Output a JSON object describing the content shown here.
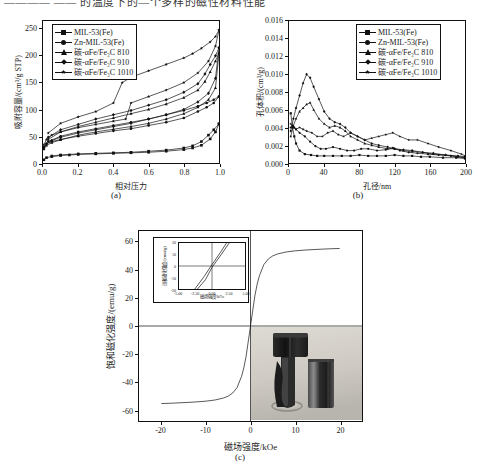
{
  "header": {
    "cropped_line": "————  ——  的温度下的—个多样的磁性材料性能"
  },
  "panels": [
    {
      "id": "a",
      "caption": "(a)",
      "xlabel": "相对压力",
      "ylabel": "吸附容量/(cm³/g STP)"
    },
    {
      "id": "b",
      "caption": "(b)",
      "xlabel": "孔径/nm",
      "ylabel": "孔体积/(cm³/g)"
    },
    {
      "id": "c",
      "caption": "(c)",
      "xlabel": "磁场强度/kOe",
      "ylabel": "饱和磁化强度/(emu/g)",
      "inset": {
        "xlabel": "磁场强度/kOe",
        "ylabel": "饱和磁化强度/(emu/g)"
      },
      "photo_alt": "磁铁吸附照片"
    }
  ],
  "legend": {
    "entries": [
      {
        "label": "MIL-53(Fe)",
        "marker": "sq",
        "color": "#111111"
      },
      {
        "label": "Zn-MIL-53(Fe)",
        "marker": "cir",
        "color": "#111111"
      },
      {
        "label": "碳-αFe/Fe₃C 810",
        "marker": "tri",
        "color": "#111111"
      },
      {
        "label": "碳-αFe/Fe₃C 910",
        "marker": "dia",
        "color": "#111111"
      },
      {
        "label": "碳-αFe/Fe₃C 1010",
        "marker": "star",
        "color": "#111111"
      }
    ]
  },
  "chart_data": [
    {
      "type": "line",
      "panel": "a",
      "title": "",
      "xlabel": "相对压力",
      "ylabel": "吸附容量/(cm³/g STP)",
      "xlim": [
        0.0,
        1.0
      ],
      "ylim": [
        0,
        265
      ],
      "xticks": [
        "0.0",
        "0.2",
        "0.4",
        "0.6",
        "0.8",
        "1.0"
      ],
      "yticks": [
        "0",
        "50",
        "100",
        "150",
        "200",
        "250"
      ],
      "grid": false,
      "legend_position": "top-left",
      "series": [
        {
          "name": "MIL-53(Fe)",
          "marker": "sq",
          "adsorption_x": [
            0.005,
            0.02,
            0.05,
            0.1,
            0.15,
            0.2,
            0.3,
            0.4,
            0.5,
            0.6,
            0.7,
            0.8,
            0.85,
            0.9,
            0.95,
            0.98,
            1.0
          ],
          "adsorption_y": [
            6,
            10,
            12,
            14,
            15,
            16,
            17,
            18,
            19,
            20,
            22,
            25,
            28,
            33,
            45,
            58,
            73
          ],
          "desorption_x": [
            1.0,
            0.97,
            0.94,
            0.9,
            0.85,
            0.8,
            0.7,
            0.6,
            0.5,
            0.4,
            0.3,
            0.2,
            0.1,
            0.05
          ],
          "desorption_y": [
            73,
            62,
            52,
            40,
            32,
            28,
            24,
            22,
            20,
            19,
            18,
            17,
            15,
            13
          ]
        },
        {
          "name": "Zn-MIL-53(Fe)",
          "marker": "cir",
          "adsorption_x": [
            0.005,
            0.02,
            0.05,
            0.1,
            0.2,
            0.3,
            0.4,
            0.5,
            0.6,
            0.7,
            0.8,
            0.88,
            0.93,
            0.97,
            1.0
          ],
          "adsorption_y": [
            30,
            36,
            40,
            44,
            50,
            55,
            60,
            64,
            70,
            76,
            84,
            96,
            104,
            112,
            124
          ],
          "desorption_x": [
            1.0,
            0.97,
            0.93,
            0.88,
            0.8,
            0.7,
            0.6,
            0.5,
            0.4,
            0.3,
            0.2,
            0.1,
            0.03
          ],
          "desorption_y": [
            124,
            118,
            112,
            106,
            98,
            90,
            82,
            76,
            70,
            64,
            58,
            50,
            40
          ]
        },
        {
          "name": "碳-αFe/Fe₃C 810",
          "marker": "tri",
          "adsorption_x": [
            0.005,
            0.02,
            0.05,
            0.1,
            0.2,
            0.3,
            0.4,
            0.5,
            0.6,
            0.7,
            0.8,
            0.88,
            0.94,
            0.98,
            1.0
          ],
          "adsorption_y": [
            26,
            33,
            38,
            43,
            52,
            58,
            63,
            68,
            74,
            82,
            92,
            104,
            118,
            140,
            205
          ],
          "desorption_x": [
            1.0,
            0.98,
            0.95,
            0.92,
            0.88,
            0.8,
            0.7,
            0.6,
            0.5,
            0.4,
            0.3,
            0.2,
            0.1,
            0.03
          ],
          "desorption_y": [
            205,
            190,
            170,
            152,
            136,
            122,
            110,
            100,
            92,
            84,
            76,
            68,
            58,
            44
          ]
        },
        {
          "name": "碳-αFe/Fe₃C 910",
          "marker": "dia",
          "adsorption_x": [
            0.005,
            0.02,
            0.05,
            0.1,
            0.2,
            0.3,
            0.4,
            0.5,
            0.6,
            0.7,
            0.8,
            0.88,
            0.94,
            0.98,
            1.0
          ],
          "adsorption_y": [
            28,
            36,
            42,
            48,
            56,
            62,
            68,
            74,
            82,
            90,
            100,
            114,
            130,
            158,
            215
          ],
          "desorption_x": [
            1.0,
            0.98,
            0.95,
            0.92,
            0.88,
            0.8,
            0.7,
            0.6,
            0.5,
            0.4,
            0.3,
            0.2,
            0.1,
            0.03
          ],
          "desorption_y": [
            215,
            200,
            184,
            166,
            148,
            132,
            118,
            108,
            98,
            90,
            82,
            72,
            62,
            48
          ]
        },
        {
          "name": "碳-αFe/Fe₃C 1010",
          "marker": "star",
          "adsorption_x": [
            0.005,
            0.02,
            0.05,
            0.1,
            0.2,
            0.3,
            0.4,
            0.47,
            0.5,
            0.6,
            0.7,
            0.8,
            0.88,
            0.94,
            0.98,
            1.0
          ],
          "adsorption_y": [
            34,
            44,
            52,
            58,
            66,
            72,
            78,
            82,
            112,
            124,
            136,
            150,
            168,
            190,
            218,
            248
          ],
          "desorption_x": [
            1.0,
            0.98,
            0.95,
            0.9,
            0.85,
            0.8,
            0.7,
            0.6,
            0.5,
            0.45,
            0.4,
            0.3,
            0.2,
            0.1,
            0.03
          ],
          "desorption_y": [
            248,
            236,
            226,
            214,
            204,
            196,
            184,
            172,
            160,
            150,
            112,
            96,
            86,
            74,
            56
          ]
        }
      ]
    },
    {
      "type": "line",
      "panel": "b",
      "title": "",
      "xlabel": "孔径/nm",
      "ylabel": "孔体积/(cm³/g)",
      "xlim": [
        0,
        200
      ],
      "ylim": [
        0.0,
        0.016
      ],
      "xticks": [
        "0",
        "40",
        "80",
        "120",
        "160",
        "200"
      ],
      "yticks": [
        "0.000",
        "0.002",
        "0.004",
        "0.006",
        "0.008",
        "0.010",
        "0.012",
        "0.014",
        "0.016"
      ],
      "grid": false,
      "legend_position": "top-right",
      "series": [
        {
          "name": "MIL-53(Fe)",
          "marker": "sq",
          "x": [
            2,
            4,
            6,
            8,
            12,
            18,
            25,
            32,
            40,
            50,
            60,
            70,
            80,
            90,
            100,
            110,
            120,
            130,
            140,
            150,
            160,
            175,
            190,
            200
          ],
          "y": [
            0.0056,
            0.004,
            0.003,
            0.0022,
            0.0014,
            0.001,
            0.0009,
            0.0008,
            0.0008,
            0.0008,
            0.0008,
            0.0008,
            0.0009,
            0.0008,
            0.0008,
            0.0008,
            0.0009,
            0.0008,
            0.0008,
            0.0007,
            0.0007,
            0.0006,
            0.0006,
            0.0005
          ]
        },
        {
          "name": "Zn-MIL-53(Fe)",
          "marker": "cir",
          "x": [
            2,
            4,
            6,
            8,
            12,
            18,
            24,
            30,
            36,
            42,
            50,
            58,
            66,
            74,
            82,
            90,
            100,
            110,
            118,
            126,
            136,
            146,
            158,
            170,
            184,
            200
          ],
          "y": [
            0.004,
            0.0042,
            0.004,
            0.0038,
            0.0034,
            0.003,
            0.0024,
            0.0019,
            0.0016,
            0.0016,
            0.0018,
            0.0016,
            0.0014,
            0.0014,
            0.0016,
            0.0016,
            0.0014,
            0.0015,
            0.0017,
            0.0014,
            0.0012,
            0.0011,
            0.001,
            0.0009,
            0.0008,
            0.0006
          ]
        },
        {
          "name": "碳-αFe/Fe₃C 810",
          "marker": "tri",
          "x": [
            2,
            5,
            8,
            12,
            16,
            20,
            24,
            28,
            34,
            40,
            46,
            52,
            58,
            64,
            70,
            78,
            86,
            94,
            102,
            112,
            120,
            130,
            140,
            152,
            164,
            178,
            192,
            200
          ],
          "y": [
            0.003,
            0.0042,
            0.005,
            0.0058,
            0.0062,
            0.0066,
            0.0068,
            0.006,
            0.005,
            0.0044,
            0.004,
            0.0042,
            0.004,
            0.0036,
            0.003,
            0.0026,
            0.0022,
            0.002,
            0.0018,
            0.0016,
            0.0016,
            0.0014,
            0.0013,
            0.0012,
            0.001,
            0.0009,
            0.0007,
            0.0006
          ]
        },
        {
          "name": "碳-αFe/Fe₃C 910",
          "marker": "dia",
          "x": [
            2,
            5,
            8,
            12,
            16,
            20,
            24,
            28,
            34,
            40,
            46,
            52,
            58,
            64,
            70,
            78,
            86,
            94,
            102,
            112,
            120,
            130,
            140,
            152,
            164,
            178,
            192,
            200
          ],
          "y": [
            0.0036,
            0.005,
            0.0062,
            0.0076,
            0.009,
            0.01,
            0.0096,
            0.0086,
            0.0072,
            0.0058,
            0.005,
            0.0046,
            0.0044,
            0.004,
            0.0034,
            0.003,
            0.0026,
            0.0022,
            0.002,
            0.0018,
            0.0016,
            0.0015,
            0.0014,
            0.0012,
            0.0011,
            0.0009,
            0.0008,
            0.0007
          ]
        },
        {
          "name": "碳-αFe/Fe₃C 1010",
          "marker": "star",
          "x": [
            2,
            5,
            8,
            12,
            16,
            20,
            26,
            32,
            38,
            44,
            50,
            56,
            62,
            70,
            78,
            86,
            94,
            102,
            110,
            118,
            126,
            136,
            146,
            158,
            170,
            184,
            196,
            200
          ],
          "y": [
            0.0044,
            0.004,
            0.0038,
            0.004,
            0.0038,
            0.0036,
            0.0034,
            0.003,
            0.003,
            0.0034,
            0.0036,
            0.0032,
            0.003,
            0.0034,
            0.003,
            0.0026,
            0.0028,
            0.003,
            0.0032,
            0.0034,
            0.003,
            0.0026,
            0.0026,
            0.0022,
            0.0018,
            0.0014,
            0.001,
            0.0008
          ]
        }
      ]
    },
    {
      "type": "line",
      "panel": "c",
      "title": "",
      "xlabel": "磁场强度/kOe",
      "ylabel": "饱和磁化强度/(emu/g)",
      "xlim": [
        -25,
        25
      ],
      "ylim": [
        -68,
        68
      ],
      "xticks": [
        "-20",
        "-10",
        "0",
        "10",
        "20"
      ],
      "yticks": [
        "-60",
        "-40",
        "-20",
        "0",
        "20",
        "40",
        "60"
      ],
      "grid": false,
      "legend_position": "none",
      "saturation_magnetization": 55,
      "series": [
        {
          "name": "磁滞回线",
          "marker": "none",
          "x": [
            -20,
            -18,
            -16,
            -14,
            -12,
            -10,
            -8,
            -6,
            -5,
            -4,
            -3,
            -2,
            -1.5,
            -1,
            -0.5,
            0,
            0.5,
            1,
            1.5,
            2,
            3,
            4,
            5,
            6,
            8,
            10,
            12,
            14,
            16,
            18,
            20
          ],
          "y": [
            -55.5,
            -55.3,
            -55.0,
            -54.7,
            -54.3,
            -53.8,
            -53.0,
            -51.5,
            -50.2,
            -48.0,
            -44.0,
            -36.0,
            -30.0,
            -22.0,
            -11.0,
            0,
            11.0,
            22.0,
            30.0,
            36.0,
            44.0,
            48.0,
            50.2,
            51.5,
            53.0,
            53.8,
            54.3,
            54.7,
            55.0,
            55.3,
            55.5
          ]
        }
      ],
      "inset": {
        "type": "line",
        "xlabel": "磁场强度/kOe",
        "ylabel": "饱和磁化强度/(emu/g)",
        "xlim": [
          -5.0,
          5.0
        ],
        "ylim": [
          -20,
          20
        ],
        "xticks": [
          "-5.00",
          "-2.50",
          "0.00",
          "2.50",
          "5.00"
        ],
        "yticks": [
          "-20",
          "-10",
          "0",
          "10",
          "20"
        ],
        "series": [
          {
            "name": "上行支",
            "x": [
              -2.6,
              -1.3,
              0,
              1.3,
              2.2
            ],
            "y": [
              -20,
              -10,
              1.2,
              12,
              20
            ]
          },
          {
            "name": "下行支",
            "x": [
              -2.2,
              -1.0,
              0,
              1.4,
              2.6
            ],
            "y": [
              -20,
              -12,
              -1.2,
              10,
              20
            ]
          }
        ]
      }
    }
  ]
}
